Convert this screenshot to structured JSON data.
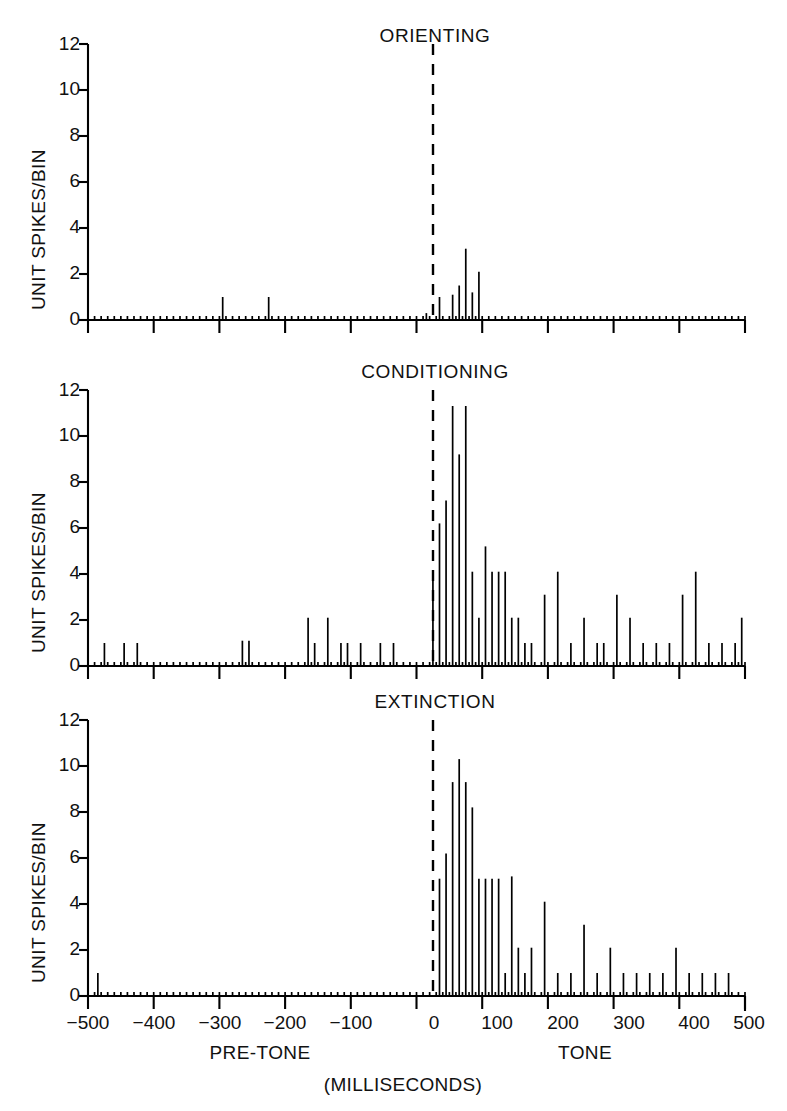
{
  "figure": {
    "y_axis_label": "UNIT SPIKES/BIN",
    "x_axis_label": "(MILLISECONDS)",
    "pre_tone_label": "PRE-TONE",
    "tone_label": "TONE",
    "ink_color": "#000000",
    "background_color": "#ffffff"
  },
  "y_ticks": [
    "0",
    "2",
    "4",
    "6",
    "8",
    "10",
    "12"
  ],
  "x_ticks": [
    "−500",
    "−400",
    "−300",
    "−200",
    "−100",
    "0",
    "100",
    "200",
    "300",
    "400",
    "500"
  ],
  "panels": [
    {
      "title": "ORIENTING"
    },
    {
      "title": "CONDITIONING"
    },
    {
      "title": "EXTINCTION"
    }
  ],
  "chart_data": [
    {
      "type": "bar",
      "title": "ORIENTING",
      "xlabel": "(MILLISECONDS)",
      "ylabel": "UNIT SPIKES/BIN",
      "xlim": [
        -500,
        500
      ],
      "ylim": [
        0,
        12
      ],
      "yticks": [
        0,
        2,
        4,
        6,
        8,
        10,
        12
      ],
      "xticks": [
        -500,
        -400,
        -300,
        -200,
        -100,
        0,
        100,
        200,
        300,
        400,
        500
      ],
      "bin_width_ms": 10,
      "grid": false,
      "legend": null,
      "annotations": [
        {
          "text": "PRE-TONE",
          "x": -250,
          "kind": "region-label"
        },
        {
          "text": "TONE",
          "x": 250,
          "kind": "region-label"
        },
        {
          "text": "stimulus-onset",
          "x": 0,
          "kind": "dashed-vertical-line"
        }
      ],
      "x": [
        -295,
        -225,
        15,
        35,
        55,
        65,
        75,
        85,
        95
      ],
      "values": [
        1,
        1,
        0.3,
        1,
        1.1,
        1.5,
        3.1,
        1.2,
        2.1
      ]
    },
    {
      "type": "bar",
      "title": "CONDITIONING",
      "xlabel": "(MILLISECONDS)",
      "ylabel": "UNIT SPIKES/BIN",
      "xlim": [
        -500,
        500
      ],
      "ylim": [
        0,
        12
      ],
      "yticks": [
        0,
        2,
        4,
        6,
        8,
        10,
        12
      ],
      "xticks": [
        -500,
        -400,
        -300,
        -200,
        -100,
        0,
        100,
        200,
        300,
        400,
        500
      ],
      "bin_width_ms": 10,
      "grid": false,
      "legend": null,
      "annotations": [
        {
          "text": "PRE-TONE",
          "x": -250,
          "kind": "region-label"
        },
        {
          "text": "TONE",
          "x": 250,
          "kind": "region-label"
        },
        {
          "text": "stimulus-onset",
          "x": 0,
          "kind": "dashed-vertical-line"
        }
      ],
      "x": [
        -475,
        -445,
        -425,
        -265,
        -255,
        -165,
        -155,
        -135,
        -115,
        -105,
        -85,
        -55,
        -35,
        25,
        35,
        45,
        55,
        65,
        75,
        85,
        95,
        105,
        115,
        125,
        135,
        145,
        155,
        165,
        175,
        195,
        215,
        235,
        255,
        275,
        285,
        305,
        325,
        345,
        365,
        385,
        405,
        425,
        445,
        465,
        485,
        495
      ],
      "values": [
        1,
        1,
        1,
        1.1,
        1.1,
        2.1,
        1,
        2.1,
        1,
        1,
        1,
        1,
        1,
        4.1,
        6.2,
        7.2,
        11.3,
        9.2,
        11.3,
        4.1,
        2.1,
        5.2,
        4.1,
        4.1,
        4.1,
        2.1,
        2.1,
        1,
        1,
        3.1,
        4.1,
        1,
        2.1,
        1,
        1,
        3.1,
        2.1,
        1,
        1,
        1,
        3.1,
        4.1,
        1,
        1,
        1,
        2.1
      ]
    },
    {
      "type": "bar",
      "title": "EXTINCTION",
      "xlabel": "(MILLISECONDS)",
      "ylabel": "UNIT SPIKES/BIN",
      "xlim": [
        -500,
        500
      ],
      "ylim": [
        0,
        12
      ],
      "yticks": [
        0,
        2,
        4,
        6,
        8,
        10,
        12
      ],
      "xticks": [
        -500,
        -400,
        -300,
        -200,
        -100,
        0,
        100,
        200,
        300,
        400,
        500
      ],
      "bin_width_ms": 10,
      "grid": false,
      "legend": null,
      "annotations": [
        {
          "text": "PRE-TONE",
          "x": -250,
          "kind": "region-label"
        },
        {
          "text": "TONE",
          "x": 250,
          "kind": "region-label"
        },
        {
          "text": "stimulus-onset",
          "x": 0,
          "kind": "dashed-vertical-line"
        }
      ],
      "x": [
        -485,
        35,
        45,
        55,
        65,
        75,
        85,
        95,
        105,
        115,
        125,
        135,
        145,
        155,
        165,
        175,
        195,
        215,
        235,
        255,
        275,
        295,
        315,
        335,
        355,
        375,
        395,
        415,
        435,
        455,
        475
      ],
      "values": [
        1,
        5.1,
        6.2,
        9.3,
        10.3,
        9.3,
        8.2,
        5.1,
        5.1,
        5.1,
        5.1,
        1,
        5.2,
        2.1,
        1,
        2.1,
        4.1,
        1,
        1,
        3.1,
        1,
        2.1,
        1,
        1,
        1,
        1,
        2.1,
        1,
        1,
        1,
        1
      ]
    }
  ]
}
